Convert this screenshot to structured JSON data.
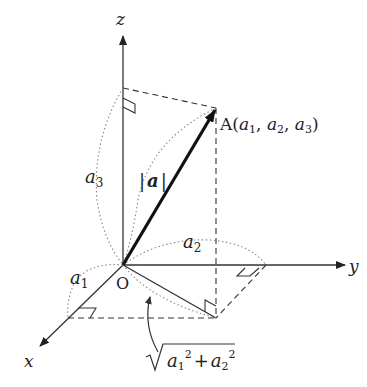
{
  "diagram": {
    "type": "3d-vector-magnitude",
    "axes": {
      "x_label": "x",
      "y_label": "y",
      "z_label": "z",
      "origin_label": "O"
    },
    "point": {
      "name": "A",
      "coords_text": "(a1, a2, a3)",
      "name_part": "A(",
      "a": "a",
      "sub1": "1",
      "sub2": "2",
      "sub3": "3",
      "comma": ", ",
      "close": ")"
    },
    "labels": {
      "magnitude": "|a|",
      "mag_bar_left": "|",
      "mag_letter": "a",
      "mag_bar_right": "|",
      "a1_letter": "a",
      "a1_sub": "1",
      "a2_letter": "a",
      "a2_sub": "2",
      "a3_letter": "a",
      "a3_sub": "3",
      "sqrt_expression": "√(a1² + a2²)",
      "sqrt_a": "a",
      "sqrt_sub1": "1",
      "sqrt_sup": "2",
      "sqrt_plus": "+",
      "sqrt_sub2": "2"
    },
    "colors": {
      "line": "#333333",
      "vector": "#111111",
      "dotted": "#888888"
    }
  }
}
